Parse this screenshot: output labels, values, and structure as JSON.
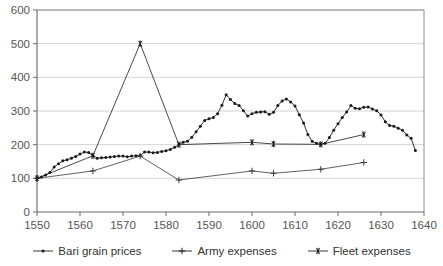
{
  "chart_data": {
    "type": "line",
    "title": "",
    "xlabel": "",
    "ylabel": "",
    "xlim": [
      1550,
      1640
    ],
    "ylim": [
      0,
      600
    ],
    "xticks": [
      1550,
      1560,
      1570,
      1580,
      1590,
      1600,
      1610,
      1620,
      1630,
      1640
    ],
    "yticks": [
      0,
      100,
      200,
      300,
      400,
      500,
      600
    ],
    "grid": "horizontal",
    "legend_position": "bottom",
    "series": [
      {
        "name": "Bari grain prices",
        "marker": "dot",
        "color": "#1a1a1a",
        "points": [
          [
            1550,
            100
          ],
          [
            1551,
            104
          ],
          [
            1552,
            110
          ],
          [
            1553,
            117
          ],
          [
            1554,
            134
          ],
          [
            1555,
            143
          ],
          [
            1556,
            152
          ],
          [
            1557,
            155
          ],
          [
            1558,
            160
          ],
          [
            1559,
            165
          ],
          [
            1560,
            172
          ],
          [
            1561,
            178
          ],
          [
            1562,
            177
          ],
          [
            1563,
            168
          ],
          [
            1564,
            160
          ],
          [
            1565,
            161
          ],
          [
            1566,
            162
          ],
          [
            1567,
            163
          ],
          [
            1568,
            165
          ],
          [
            1569,
            166
          ],
          [
            1570,
            166
          ],
          [
            1571,
            164
          ],
          [
            1572,
            166
          ],
          [
            1573,
            167
          ],
          [
            1574,
            168
          ],
          [
            1575,
            178
          ],
          [
            1576,
            178
          ],
          [
            1577,
            176
          ],
          [
            1578,
            177
          ],
          [
            1579,
            180
          ],
          [
            1580,
            182
          ],
          [
            1581,
            186
          ],
          [
            1582,
            192
          ],
          [
            1583,
            200
          ],
          [
            1584,
            207
          ],
          [
            1585,
            210
          ],
          [
            1586,
            222
          ],
          [
            1587,
            238
          ],
          [
            1588,
            255
          ],
          [
            1589,
            272
          ],
          [
            1590,
            277
          ],
          [
            1591,
            281
          ],
          [
            1592,
            292
          ],
          [
            1593,
            317
          ],
          [
            1594,
            348
          ],
          [
            1595,
            334
          ],
          [
            1596,
            322
          ],
          [
            1597,
            316
          ],
          [
            1598,
            301
          ],
          [
            1599,
            285
          ],
          [
            1600,
            292
          ],
          [
            1601,
            296
          ],
          [
            1602,
            297
          ],
          [
            1603,
            298
          ],
          [
            1604,
            290
          ],
          [
            1605,
            296
          ],
          [
            1606,
            316
          ],
          [
            1607,
            330
          ],
          [
            1608,
            336
          ],
          [
            1609,
            327
          ],
          [
            1610,
            315
          ],
          [
            1611,
            289
          ],
          [
            1612,
            264
          ],
          [
            1613,
            230
          ],
          [
            1614,
            210
          ],
          [
            1615,
            204
          ],
          [
            1616,
            201
          ],
          [
            1617,
            204
          ],
          [
            1618,
            221
          ],
          [
            1619,
            243
          ],
          [
            1620,
            262
          ],
          [
            1621,
            281
          ],
          [
            1622,
            297
          ],
          [
            1623,
            316
          ],
          [
            1624,
            308
          ],
          [
            1625,
            307
          ],
          [
            1626,
            311
          ],
          [
            1627,
            312
          ],
          [
            1628,
            306
          ],
          [
            1629,
            301
          ],
          [
            1630,
            288
          ],
          [
            1631,
            268
          ],
          [
            1632,
            257
          ],
          [
            1633,
            255
          ],
          [
            1634,
            249
          ],
          [
            1635,
            243
          ],
          [
            1636,
            229
          ],
          [
            1637,
            219
          ],
          [
            1638,
            183
          ]
        ]
      },
      {
        "name": "Army expenses",
        "marker": "plus",
        "color": "#3a3a3a",
        "points": [
          [
            1550,
            100
          ],
          [
            1563,
            122
          ],
          [
            1574,
            166
          ],
          [
            1583,
            95
          ],
          [
            1600,
            122
          ],
          [
            1605,
            115
          ],
          [
            1616,
            127
          ],
          [
            1626,
            147
          ]
        ]
      },
      {
        "name": "Fleet expenses",
        "marker": "asterisk",
        "color": "#1a1a1a",
        "points": [
          [
            1550,
            100
          ],
          [
            1563,
            167
          ],
          [
            1574,
            500
          ],
          [
            1583,
            200
          ],
          [
            1600,
            207
          ],
          [
            1605,
            202
          ],
          [
            1616,
            201
          ],
          [
            1626,
            230
          ]
        ]
      }
    ]
  },
  "legend": {
    "items": [
      {
        "label": "Bari grain prices",
        "marker": "dot"
      },
      {
        "label": "Army expenses",
        "marker": "plus"
      },
      {
        "label": "Fleet expenses",
        "marker": "asterisk"
      }
    ]
  },
  "axes": {
    "y_labels": [
      "600",
      "500",
      "400",
      "300",
      "200",
      "100",
      "0"
    ],
    "x_labels": [
      "1550",
      "1560",
      "1570",
      "1580",
      "1590",
      "1600",
      "1610",
      "1620",
      "1630",
      "1640"
    ]
  }
}
